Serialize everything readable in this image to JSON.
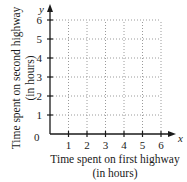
{
  "chart_data": {
    "type": "scatter",
    "title": "",
    "xlabel": "Time spent on first highway (in hours)",
    "ylabel": "Time spent on second highway (in hours)",
    "x_axis_variable": "x",
    "y_axis_variable": "y",
    "origin_label": "0",
    "xlim": [
      0,
      6
    ],
    "ylim": [
      0,
      6
    ],
    "x_ticks": [
      1,
      2,
      3,
      4,
      5,
      6
    ],
    "y_ticks": [
      1,
      2,
      3,
      4,
      5,
      6
    ],
    "grid": true,
    "grid_style": "dotted",
    "legend": null,
    "series": []
  },
  "labels": {
    "xlabel_line1": "Time spent on first highway",
    "xlabel_line2": "(in hours)",
    "ylabel_line1": "Time spent on second highway",
    "ylabel_line2": "(in hours)",
    "x_var": "x",
    "y_var": "y",
    "origin": "0",
    "x_ticks": [
      "1",
      "2",
      "3",
      "4",
      "5",
      "6"
    ],
    "y_ticks": [
      "1",
      "2",
      "3",
      "4",
      "5",
      "6"
    ]
  },
  "colors": {
    "axis": "#1a1a1a",
    "grid": "#9a9a9a"
  }
}
